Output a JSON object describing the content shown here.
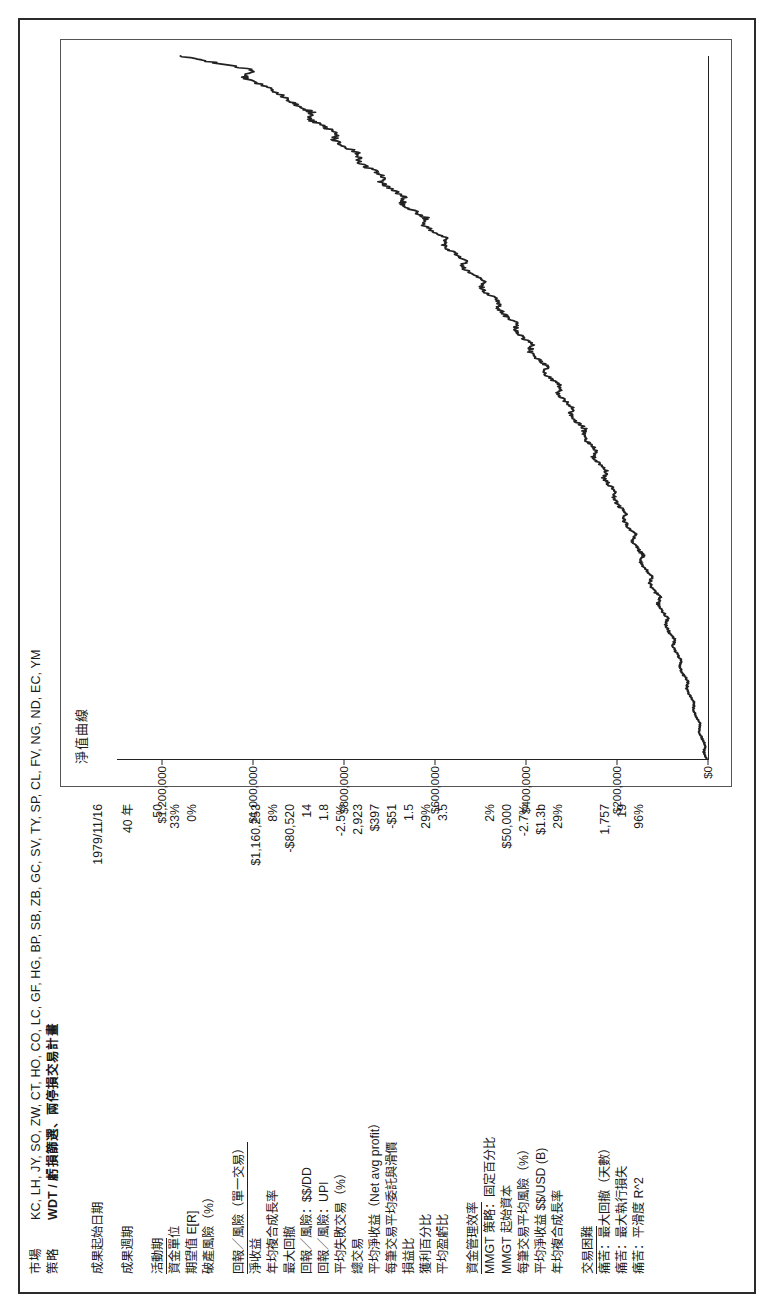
{
  "header": {
    "market_label": "市場",
    "market_value": "KC, LH, JY, SO, ZW, CT, HO, CO, LC, GF, HG, BP, SB, ZB, GC, SV, TY, SP, CL, FV, NG, ND, EC, YM",
    "strategy_label": "策略",
    "strategy_value": "WDT / 虧損篩選、兩停損交易計畫"
  },
  "stats": [
    {
      "label": "成果起始日期",
      "value": "1979/11/16",
      "type": "plain"
    },
    {
      "label": "",
      "value": "",
      "type": "spacer"
    },
    {
      "label": "成果週期",
      "value": "40 年",
      "type": "plain"
    },
    {
      "label": "",
      "value": "",
      "type": "spacer"
    },
    {
      "label": "活動期",
      "value": "50",
      "type": "underline"
    },
    {
      "label": "資金單位",
      "value": "33%",
      "type": "plain"
    },
    {
      "label": "期望值 E[R]",
      "value": "0%",
      "type": "plain"
    },
    {
      "label": "破產風險（%）",
      "value": "",
      "type": "plain"
    },
    {
      "label": "",
      "value": "",
      "type": "spacer"
    },
    {
      "label": "回報／風險（單一交易）",
      "value": "",
      "type": "underline"
    },
    {
      "label": "淨收益",
      "value": "$1,160,253",
      "type": "plain"
    },
    {
      "label": "年均複合成長率",
      "value": "8%",
      "type": "plain"
    },
    {
      "label": "最大回撤",
      "value": "-$80,520",
      "type": "plain"
    },
    {
      "label": "回報／風險：$$/DD",
      "value": "14",
      "type": "plain"
    },
    {
      "label": "回報／風險：UPI",
      "value": "1.8",
      "type": "plain"
    },
    {
      "label": "平均失敗交易（%）",
      "value": "-2.5%",
      "type": "plain"
    },
    {
      "label": "總交易",
      "value": "2,923",
      "type": "plain"
    },
    {
      "label": "平均淨收益（Net avg profit）",
      "value": "$397",
      "type": "plain"
    },
    {
      "label": "每筆交易平均委託與滑價",
      "value": "-$51",
      "type": "plain"
    },
    {
      "label": "損益比",
      "value": "1.5",
      "type": "plain"
    },
    {
      "label": "獲利百分比",
      "value": "29%",
      "type": "plain"
    },
    {
      "label": "平均盈虧比",
      "value": "3.5",
      "type": "plain"
    },
    {
      "label": "",
      "value": "",
      "type": "spacer"
    },
    {
      "label": "資金管理效率",
      "value": "",
      "type": "underline"
    },
    {
      "label": "MMGT 策略：固定百分比",
      "value": "2%",
      "type": "plain"
    },
    {
      "label": "MMGT 起始資本",
      "value": "$50,000",
      "type": "plain"
    },
    {
      "label": "每筆交易平均風險（%）",
      "value": "-2.7%",
      "type": "plain"
    },
    {
      "label": "平均淨收益 $$/USD (B)",
      "value": "$1.3b",
      "type": "plain"
    },
    {
      "label": "年均複合成長率",
      "value": "29%",
      "type": "plain"
    },
    {
      "label": "",
      "value": "",
      "type": "spacer"
    },
    {
      "label": "交易困難",
      "value": "",
      "type": "underline"
    },
    {
      "label": "痛苦：最大回撤（天數）",
      "value": "1,757",
      "type": "plain"
    },
    {
      "label": "痛苦：最大執行損失",
      "value": "19",
      "type": "plain"
    },
    {
      "label": "痛苦：平滑度 R^2",
      "value": "96%",
      "type": "plain"
    }
  ],
  "chart_data": {
    "type": "line",
    "title": "淨值曲線",
    "xlabel": "",
    "ylabel": "",
    "grid": false,
    "legend": null,
    "ylim": [
      0,
      1300000
    ],
    "yticks": [
      0,
      200000,
      400000,
      600000,
      800000,
      1000000,
      1200000
    ],
    "ytick_labels": [
      "$0",
      "$200,000",
      "$400,000",
      "$600,000",
      "$800,000",
      "$1,000,000",
      "$1,200,000"
    ],
    "xlim": [
      0,
      100
    ],
    "series_name": "Equity",
    "line_color": "#222222",
    "x": [
      0,
      1,
      2,
      3,
      4,
      5,
      6,
      7,
      8,
      9,
      10,
      11,
      12,
      13,
      14,
      15,
      16,
      17,
      18,
      19,
      20,
      21,
      22,
      23,
      24,
      25,
      26,
      27,
      28,
      29,
      30,
      31,
      32,
      33,
      34,
      35,
      36,
      37,
      38,
      39,
      40,
      41,
      42,
      43,
      44,
      45,
      46,
      47,
      48,
      49,
      50,
      51,
      52,
      53,
      54,
      55,
      56,
      57,
      58,
      59,
      60,
      61,
      62,
      63,
      64,
      65,
      66,
      67,
      68,
      69,
      70,
      71,
      72,
      73,
      74,
      75,
      76,
      77,
      78,
      79,
      80,
      81,
      82,
      83,
      84,
      85,
      86,
      87,
      88,
      89,
      90,
      91,
      92,
      93,
      94,
      95,
      96,
      97,
      98,
      99,
      100
    ],
    "values": [
      3000,
      9000,
      6000,
      14000,
      20000,
      17000,
      26000,
      33000,
      30000,
      40000,
      47000,
      44000,
      54000,
      62000,
      58000,
      69000,
      77000,
      73000,
      85000,
      93000,
      89000,
      101000,
      110000,
      106000,
      119000,
      128000,
      124000,
      137000,
      147000,
      143000,
      156000,
      166000,
      161000,
      175000,
      186000,
      181000,
      196000,
      207000,
      202000,
      217000,
      229000,
      224000,
      240000,
      252000,
      247000,
      264000,
      276000,
      271000,
      289000,
      302000,
      297000,
      316000,
      330000,
      325000,
      345000,
      360000,
      355000,
      376000,
      392000,
      387000,
      409000,
      426000,
      421000,
      444000,
      462000,
      457000,
      481000,
      500000,
      495000,
      520000,
      540000,
      535000,
      561000,
      582000,
      577000,
      604000,
      626000,
      621000,
      649000,
      672000,
      667000,
      696000,
      720000,
      715000,
      745000,
      770000,
      765000,
      796000,
      822000,
      817000,
      849000,
      876000,
      871000,
      904000,
      932000,
      950000,
      985000,
      1020000,
      1000000,
      1080000,
      1160253
    ]
  }
}
